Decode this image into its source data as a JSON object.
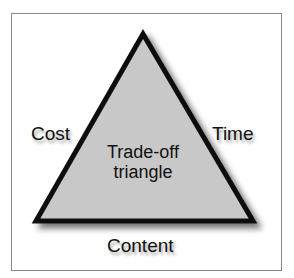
{
  "diagram": {
    "title": "Trade-off triangle",
    "center_label_line1": "Trade-off",
    "center_label_line2": "triangle",
    "vertices_labels": {
      "left": "Cost",
      "right": "Time",
      "bottom": "Content"
    },
    "colors": {
      "fill": "#c8c8c8",
      "stroke": "#111111",
      "frame": "#8a8a8a"
    }
  }
}
